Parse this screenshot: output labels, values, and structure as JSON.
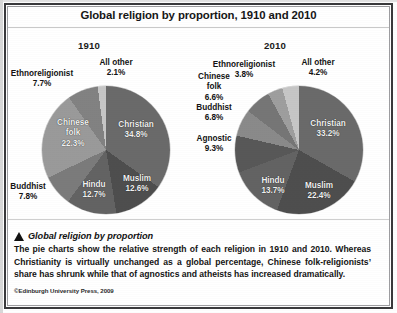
{
  "title": "Global religion by proportion, 1910 and 2010",
  "charts": [
    {
      "year_label": "1910",
      "labels": {
        "christian": "Christian",
        "christian_pct": "34.8%",
        "muslim": "Muslim",
        "muslim_pct": "12.6%",
        "hindu": "Hindu",
        "hindu_pct": "12.7%",
        "buddhist": "Buddhist",
        "buddhist_pct": "7.8%",
        "chinese_folk": "Chinese",
        "chinese_folk2": "folk",
        "chinese_folk_pct": "22.3%",
        "ethnoreligionist": "Ethnoreligionist",
        "ethnoreligionist_pct": "7.7%",
        "all_other": "All other",
        "all_other_pct": "2.1%"
      }
    },
    {
      "year_label": "2010",
      "labels": {
        "christian": "Christian",
        "christian_pct": "33.2%",
        "muslim": "Muslim",
        "muslim_pct": "22.4%",
        "hindu": "Hindu",
        "hindu_pct": "13.7%",
        "agnostic": "Agnostic",
        "agnostic_pct": "9.3%",
        "buddhist": "Buddhist",
        "buddhist_pct": "6.8%",
        "chinese_folk": "Chinese",
        "chinese_folk2": "folk",
        "chinese_folk_pct": "6.6%",
        "ethnoreligionist": "Ethnoreligionist",
        "ethnoreligionist_pct": "3.8%",
        "all_other": "All other",
        "all_other_pct": "4.2%"
      }
    }
  ],
  "caption": {
    "marker": "triangle-marker-icon",
    "heading": "Global religion by proportion",
    "body": "The pie charts show the relative strength of each religion in 1910 and 2010. Whereas Christianity is virtually unchanged as a global percentage, Chinese folk-religionists’ share has shrunk while that of agnostics and atheists has increased dramatically.",
    "copyright": "©Edinburgh University Press, 2009"
  },
  "chart_data": [
    {
      "type": "pie",
      "title": "1910",
      "categories": [
        "Christian",
        "Muslim",
        "Hindu",
        "Buddhist",
        "Chinese folk",
        "Ethnoreligionist",
        "All other"
      ],
      "values": [
        34.8,
        12.6,
        12.7,
        7.8,
        22.3,
        7.7,
        2.1
      ],
      "unit": "percent",
      "colors": [
        "#6a6a6a",
        "#4e4e4e",
        "#636363",
        "#7b7b7b",
        "#9a9a9a",
        "#828282",
        "#c6c6c6"
      ],
      "legend": "none",
      "labels_position": "inside-and-outside",
      "start_angle_deg": 0,
      "direction": "clockwise"
    },
    {
      "type": "pie",
      "title": "2010",
      "categories": [
        "Christian",
        "Muslim",
        "Hindu",
        "Agnostic",
        "Buddhist",
        "Chinese folk",
        "Ethnoreligionist",
        "All other"
      ],
      "values": [
        33.2,
        22.4,
        13.7,
        9.3,
        6.8,
        6.6,
        3.8,
        4.2
      ],
      "unit": "percent",
      "colors": [
        "#6a6a6a",
        "#4e4e4e",
        "#636363",
        "#585858",
        "#8a8a8a",
        "#767676",
        "#9e9e9e",
        "#c6c6c6"
      ],
      "legend": "none",
      "labels_position": "inside-and-outside",
      "start_angle_deg": 0,
      "direction": "clockwise"
    }
  ]
}
